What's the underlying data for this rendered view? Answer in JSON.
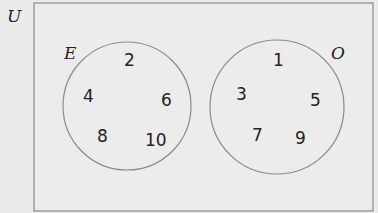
{
  "diagram": {
    "type": "venn",
    "universe_label": "U",
    "sets": [
      {
        "label": "E",
        "elements": [
          "2",
          "4",
          "6",
          "8",
          "10"
        ]
      },
      {
        "label": "O",
        "elements": [
          "1",
          "3",
          "5",
          "7",
          "9"
        ]
      }
    ],
    "colors": {
      "background": "#ebebeb",
      "stroke": "#8a8a8a",
      "text": "#222222"
    }
  }
}
